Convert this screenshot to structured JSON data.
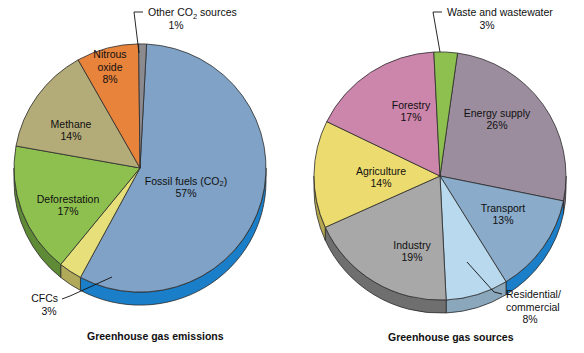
{
  "figure": {
    "background": "#ffffff",
    "text_color": "#101010"
  },
  "charts": [
    {
      "id": "greenhouse-gas-emissions",
      "caption": "Greenhouse gas emissions",
      "center": [
        140,
        168
      ],
      "radius": 126,
      "depth": 13,
      "start_angle_deg": 3,
      "slices": [
        {
          "key": "fossil-fuels",
          "label": "Fossil fuels (CO₂)",
          "label_plain": "Fossil fuels (CO2)",
          "value": 57,
          "value_label": "57%",
          "color": "#7fa2c6",
          "side_color": "#1b7ec8",
          "label_pos": [
            186,
            188
          ],
          "label_mode": "inside"
        },
        {
          "key": "cfcs",
          "label": "CFCs",
          "value": 3,
          "value_label": "3%",
          "color": "#e7e07a",
          "side_color": "#b0a95a",
          "label_pos": [
            47,
            295
          ],
          "label_mode": "callout"
        },
        {
          "key": "deforestation",
          "label": "Deforestation",
          "value": 17,
          "value_label": "17%",
          "color": "#8ec04f",
          "side_color": "#5f8a36",
          "label_pos": [
            68,
            206
          ],
          "label_mode": "inside"
        },
        {
          "key": "methane",
          "label": "Methane",
          "value": 14,
          "value_label": "14%",
          "color": "#b3ab78",
          "side_color": "#8a8358",
          "label_pos": [
            71,
            131
          ],
          "label_mode": "inside"
        },
        {
          "key": "nitrous-oxide",
          "label": "Nitrous oxide",
          "label_line1": "Nitrous",
          "label_line2": "oxide",
          "value": 8,
          "value_label": "8%",
          "color": "#e8833c",
          "side_color": "#b3632a",
          "label_pos": [
            110,
            68
          ],
          "label_mode": "inside"
        },
        {
          "key": "other-co2-sources",
          "label": "Other CO₂ sources",
          "label_plain": "Other CO2 sources",
          "value": 1,
          "value_label": "1%",
          "color": "#8a8a8f",
          "side_color": "#6a6a70",
          "label_pos": [
            178,
            12
          ],
          "label_mode": "callout"
        }
      ]
    },
    {
      "id": "greenhouse-gas-sources",
      "caption": "Greenhouse gas sources",
      "center": [
        440,
        176
      ],
      "radius": 126,
      "depth": 13,
      "start_angle_deg": 8,
      "slices": [
        {
          "key": "energy-supply",
          "label": "Energy supply",
          "value": 26,
          "value_label": "26%",
          "color": "#9c8d9e",
          "side_color": "#766a78",
          "label_pos": [
            497,
            120
          ],
          "label_mode": "inside"
        },
        {
          "key": "transport",
          "label": "Transport",
          "value": 13,
          "value_label": "13%",
          "color": "#8aabc9",
          "side_color": "#1b7ec8",
          "label_pos": [
            503,
            215
          ],
          "label_mode": "inside"
        },
        {
          "key": "residential-commercial",
          "label": "Residential/ commercial",
          "label_line1": "Residential/",
          "label_line2": "commercial",
          "value": 8,
          "value_label": "8%",
          "color": "#b9d9ef",
          "side_color": "#8aa7bb",
          "label_pos": [
            513,
            303
          ],
          "label_mode": "callout"
        },
        {
          "key": "industry",
          "label": "Industry",
          "value": 19,
          "value_label": "19%",
          "color": "#a8a8a8",
          "side_color": "#6f6f6f",
          "label_pos": [
            412,
            252
          ],
          "label_mode": "inside"
        },
        {
          "key": "agriculture",
          "label": "Agriculture",
          "value": 14,
          "value_label": "14%",
          "color": "#ecdb6e",
          "side_color": "#b4a74f",
          "label_pos": [
            381,
            178
          ],
          "label_mode": "inside"
        },
        {
          "key": "forestry",
          "label": "Forestry",
          "value": 17,
          "value_label": "17%",
          "color": "#cc85ab",
          "side_color": "#9c6281",
          "label_pos": [
            411,
            112
          ],
          "label_mode": "inside"
        },
        {
          "key": "waste-and-wastewater",
          "label": "Waste and wastewater",
          "value": 3,
          "value_label": "3%",
          "color": "#8ec04f",
          "side_color": "#5f8a36",
          "label_pos": [
            487,
            12
          ],
          "label_mode": "callout"
        }
      ]
    }
  ],
  "chart_data": [
    {
      "type": "pie",
      "title": "Greenhouse gas emissions",
      "categories": [
        "Fossil fuels (CO2)",
        "CFCs",
        "Deforestation",
        "Methane",
        "Nitrous oxide",
        "Other CO2 sources"
      ],
      "values": [
        57,
        3,
        17,
        14,
        8,
        1
      ],
      "value_labels": [
        "57%",
        "3%",
        "17%",
        "14%",
        "8%",
        "1%"
      ],
      "colors": [
        "#7fa2c6",
        "#e7e07a",
        "#8ec04f",
        "#b3ab78",
        "#e8833c",
        "#8a8a8f"
      ],
      "units": "percent",
      "total": 100,
      "legend": "none (direct slice labels)",
      "notes": "3-D pie, slices ordered clockwise starting near 12 o'clock"
    },
    {
      "type": "pie",
      "title": "Greenhouse gas sources",
      "categories": [
        "Energy supply",
        "Transport",
        "Residential/commercial",
        "Industry",
        "Agriculture",
        "Forestry",
        "Waste and wastewater"
      ],
      "values": [
        26,
        13,
        8,
        19,
        14,
        17,
        3
      ],
      "value_labels": [
        "26%",
        "13%",
        "8%",
        "19%",
        "14%",
        "17%",
        "3%"
      ],
      "colors": [
        "#9c8d9e",
        "#8aabc9",
        "#b9d9ef",
        "#a8a8a8",
        "#ecdb6e",
        "#cc85ab",
        "#8ec04f"
      ],
      "units": "percent",
      "total": 100,
      "legend": "none (direct slice labels)",
      "notes": "3-D pie, slices ordered clockwise starting near 12 o'clock"
    }
  ]
}
